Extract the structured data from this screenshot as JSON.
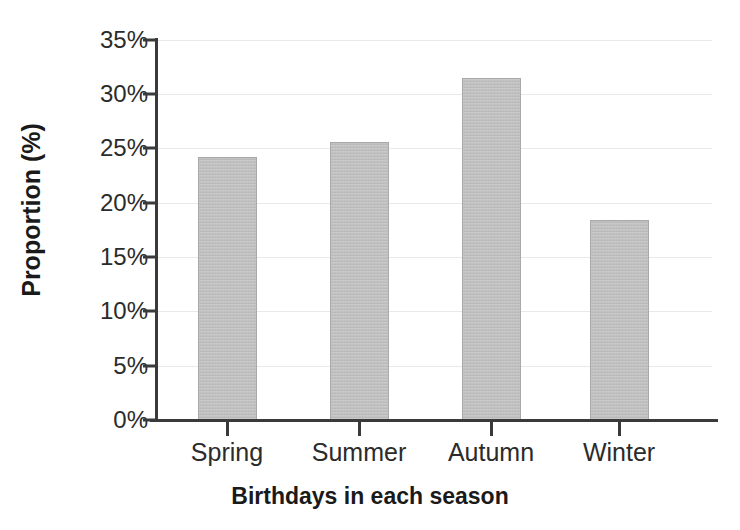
{
  "chart_data": {
    "type": "bar",
    "title": "",
    "xlabel": "Birthdays in each season",
    "ylabel": "Proportion (%)",
    "categories": [
      "Spring",
      "Summer",
      "Autumn",
      "Winter"
    ],
    "values": [
      24.2,
      25.6,
      31.5,
      18.4
    ],
    "value_labels": [
      "24.2%",
      "25.6%",
      "31.5%",
      "18.4%"
    ],
    "ylim": [
      0,
      35
    ],
    "y_tick_values": [
      0,
      5,
      10,
      15,
      20,
      25,
      30,
      35
    ],
    "y_tick_labels": [
      "0%",
      "5%",
      "10%",
      "15%",
      "20%",
      "25%",
      "30%",
      "35%"
    ],
    "grid": true,
    "grid_axis": "y",
    "legend": "none",
    "bar_color": "#bcbcbc",
    "bar_edge_color": "#a9a9a9",
    "axis_color": "#3a3a3a",
    "gridline_color": "#e9e9e9",
    "text_color": "#2b2b2b"
  },
  "axes": {
    "y_title": "Proportion (%)",
    "x_title": "Birthdays in each season"
  },
  "y_ticks": [
    {
      "label": "35%",
      "value": 35
    },
    {
      "label": "30%",
      "value": 30
    },
    {
      "label": "25%",
      "value": 25
    },
    {
      "label": "20%",
      "value": 20
    },
    {
      "label": "15%",
      "value": 15
    },
    {
      "label": "10%",
      "value": 10
    },
    {
      "label": "5%",
      "value": 5
    },
    {
      "label": "0%",
      "value": 0
    }
  ],
  "bars": [
    {
      "label": "Spring",
      "value": 24.2
    },
    {
      "label": "Summer",
      "value": 25.6
    },
    {
      "label": "Autumn",
      "value": 31.5
    },
    {
      "label": "Winter",
      "value": 18.4
    }
  ]
}
